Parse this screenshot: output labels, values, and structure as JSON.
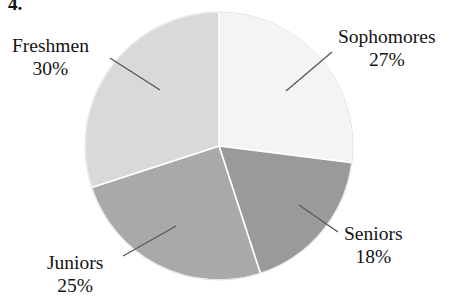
{
  "figure": {
    "question_number": "4.",
    "width": 461,
    "height": 299
  },
  "chart_data": {
    "type": "pie",
    "title": "",
    "subtitle": "",
    "xlabel": "",
    "ylabel": "",
    "legend_position": "none",
    "grid": false,
    "labels_outside": true,
    "total_percent": 100,
    "categories": [
      "Sophomores",
      "Seniors",
      "Juniors",
      "Freshmen"
    ],
    "values": [
      27,
      18,
      25,
      30
    ],
    "value_unit": "%",
    "start_angle_deg": 0,
    "direction": "clockwise",
    "slices": [
      {
        "name": "Sophomores",
        "value": 27,
        "label_name": "Sophomores",
        "label_percent": "27%",
        "color": "#f4f4f4",
        "start_deg": 0,
        "end_deg": 97.2,
        "label_position": "top-right",
        "leader_line": true
      },
      {
        "name": "Seniors",
        "value": 18,
        "label_name": "Seniors",
        "label_percent": "18%",
        "color": "#9a9a9a",
        "start_deg": 97.2,
        "end_deg": 162.0,
        "label_position": "bottom-right",
        "leader_line": true
      },
      {
        "name": "Juniors",
        "value": 25,
        "label_name": "Juniors",
        "label_percent": "25%",
        "color": "#a9a9a9",
        "start_deg": 162.0,
        "end_deg": 252.0,
        "label_position": "bottom-left",
        "leader_line": true
      },
      {
        "name": "Freshmen",
        "value": 30,
        "label_name": "Freshmen",
        "label_percent": "30%",
        "color": "#d9d9d9",
        "start_deg": 252.0,
        "end_deg": 360.0,
        "label_position": "top-left",
        "leader_line": true
      }
    ],
    "colors": {
      "sophomores": "#f4f4f4",
      "seniors": "#9a9a9a",
      "juniors": "#a9a9a9",
      "freshmen": "#d9d9d9",
      "separator": "#ffffff",
      "leader_line": "#555555",
      "text": "#131313",
      "background": "#ffffff"
    },
    "geometry": {
      "center_x": 219,
      "center_y": 146,
      "radius": 134
    }
  }
}
